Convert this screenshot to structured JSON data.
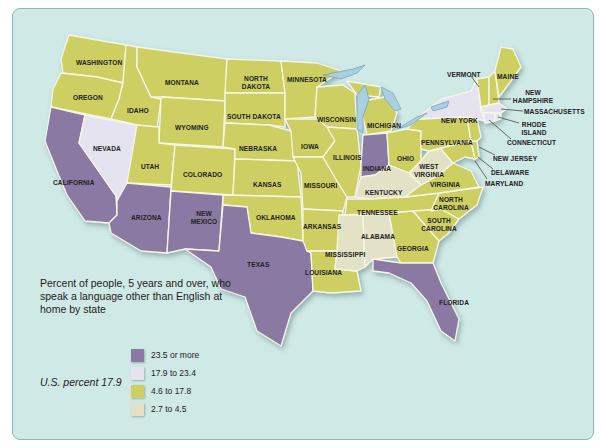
{
  "legend": {
    "title": "Percent of people, 5 years and over, who speak a language other than English at home by state",
    "us_percent": "U.S. percent 17.9",
    "items": [
      {
        "label": "23.5 or more",
        "color": "#8a7aa3"
      },
      {
        "label": "17.9 to 23.4",
        "color": "#e4e3ef"
      },
      {
        "label": "4.6 to 17.8",
        "color": "#cdcf62"
      },
      {
        "label": "2.7 to 4.5",
        "color": "#e3e2c6"
      }
    ]
  },
  "colors": {
    "ocean": "#cfe9e6",
    "lake": "#a9cfe0",
    "border": "#f7f6e6"
  },
  "states": {
    "washington": "WASHINGTON",
    "oregon": "OREGON",
    "idaho": "IDAHO",
    "montana": "MONTANA",
    "north_dakota": "NORTH DAKOTA",
    "south_dakota": "SOUTH DAKOTA",
    "minnesota": "MINNESOTA",
    "wyoming": "WYOMING",
    "nevada": "NEVADA",
    "california": "CALIFORNIA",
    "utah": "UTAH",
    "colorado": "COLORADO",
    "nebraska": "NEBRASKA",
    "iowa": "IOWA",
    "wisconsin": "WISCONSIN",
    "michigan": "MICHIGAN",
    "illinois": "ILLINOIS",
    "indiana": "INDIANA",
    "ohio": "OHIO",
    "kansas": "KANSAS",
    "missouri": "MISSOURI",
    "arizona": "ARIZONA",
    "new_mexico": "NEW MEXICO",
    "oklahoma": "OKLAHOMA",
    "arkansas": "ARKANSAS",
    "texas": "TEXAS",
    "louisiana": "LOUISIANA",
    "mississippi": "MISSISSIPPI",
    "alabama": "ALABAMA",
    "georgia": "GEORGIA",
    "florida": "FLORIDA",
    "tennessee": "TENNESSEE",
    "kentucky": "KENTUCKY",
    "west_virginia": "WEST VIRGINIA",
    "virginia": "VIRGINIA",
    "north_carolina": "NORTH CAROLINA",
    "south_carolina": "SOUTH CAROLINA",
    "pennsylvania": "PENNSYLVANIA",
    "new_york": "NEW YORK",
    "vermont": "VERMONT",
    "maine": "MAINE",
    "new_hampshire": "NEW HAMPSHIRE",
    "massachusetts": "MASSACHUSETTS",
    "rhode_island": "RHODE ISLAND",
    "connecticut": "CONNECTICUT",
    "new_jersey": "NEW JERSEY",
    "delaware": "DELAWARE",
    "maryland": "MARYLAND"
  },
  "state_categories": {
    "23.5 or more": [
      "CALIFORNIA",
      "ARIZONA",
      "NEW MEXICO",
      "TEXAS",
      "FLORIDA",
      "INDIANA"
    ],
    "17.9 to 23.4": [
      "NEVADA",
      "NEW YORK",
      "MASSACHUSETTS",
      "RHODE ISLAND",
      "CONNECTICUT"
    ],
    "4.6 to 17.8": [
      "WASHINGTON",
      "OREGON",
      "IDAHO",
      "MONTANA",
      "WYOMING",
      "UTAH",
      "COLORADO",
      "NORTH DAKOTA",
      "SOUTH DAKOTA",
      "NEBRASKA",
      "KANSAS",
      "OKLAHOMA",
      "MINNESOTA",
      "IOWA",
      "MISSOURI",
      "ARKANSAS",
      "LOUISIANA",
      "WISCONSIN",
      "ILLINOIS",
      "MICHIGAN",
      "OHIO",
      "PENNSYLVANIA",
      "NEW JERSEY",
      "DELAWARE",
      "MARYLAND",
      "VIRGINIA",
      "NORTH CAROLINA",
      "SOUTH CAROLINA",
      "GEORGIA",
      "TENNESSEE",
      "VERMONT",
      "NEW HAMPSHIRE",
      "MAINE"
    ],
    "2.7 to 4.5": [
      "KENTUCKY",
      "WEST VIRGINIA",
      "ALABAMA",
      "MISSISSIPPI"
    ]
  }
}
